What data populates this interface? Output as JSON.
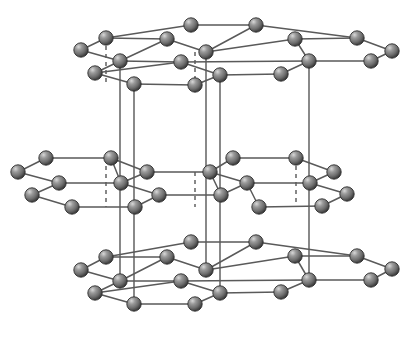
{
  "figure": {
    "type": "ball-and-stick-lattice",
    "background_color": "#ffffff",
    "atom_color_base": "#7d7d7d",
    "atom_color_shadow": "#3c3c3c",
    "atom_color_highlight": "#d8d8d8",
    "atom_outline_color": "#2f2f2f",
    "bond_color": "#5a5a5a",
    "vertical_bond_color": "#6b6b6b",
    "atom_radius": 7.2,
    "layer_count": 3,
    "layer_names": [
      "top-layer",
      "middle-layer",
      "bottom-layer"
    ]
  },
  "atoms": {
    "top_layer": [
      {
        "id": "t1",
        "x": 191,
        "y": 25
      },
      {
        "id": "t2",
        "x": 256,
        "y": 25
      },
      {
        "id": "t3",
        "x": 106,
        "y": 38
      },
      {
        "id": "t4",
        "x": 167,
        "y": 39
      },
      {
        "id": "t5",
        "x": 295,
        "y": 39
      },
      {
        "id": "t6",
        "x": 357,
        "y": 38
      },
      {
        "id": "t7",
        "x": 81,
        "y": 50
      },
      {
        "id": "t8",
        "x": 206,
        "y": 52
      },
      {
        "id": "t9",
        "x": 392,
        "y": 51
      },
      {
        "id": "t10",
        "x": 120,
        "y": 61
      },
      {
        "id": "t11",
        "x": 181,
        "y": 62
      },
      {
        "id": "t12",
        "x": 309,
        "y": 61
      },
      {
        "id": "t13",
        "x": 371,
        "y": 61
      },
      {
        "id": "t14",
        "x": 95,
        "y": 73
      },
      {
        "id": "t15",
        "x": 220,
        "y": 75
      },
      {
        "id": "t16",
        "x": 281,
        "y": 74
      },
      {
        "id": "t17",
        "x": 134,
        "y": 84
      },
      {
        "id": "t18",
        "x": 195,
        "y": 85
      }
    ],
    "middle_layer": [
      {
        "id": "m1",
        "x": 46,
        "y": 158
      },
      {
        "id": "m2",
        "x": 111,
        "y": 158
      },
      {
        "id": "m3",
        "x": 233,
        "y": 158
      },
      {
        "id": "m4",
        "x": 296,
        "y": 158
      },
      {
        "id": "m5",
        "x": 18,
        "y": 172
      },
      {
        "id": "m6",
        "x": 147,
        "y": 172
      },
      {
        "id": "m7",
        "x": 210,
        "y": 172
      },
      {
        "id": "m8",
        "x": 334,
        "y": 172
      },
      {
        "id": "m9",
        "x": 59,
        "y": 183
      },
      {
        "id": "m10",
        "x": 121,
        "y": 183
      },
      {
        "id": "m11",
        "x": 247,
        "y": 183
      },
      {
        "id": "m12",
        "x": 310,
        "y": 183
      },
      {
        "id": "m13",
        "x": 32,
        "y": 195
      },
      {
        "id": "m14",
        "x": 159,
        "y": 195
      },
      {
        "id": "m15",
        "x": 221,
        "y": 195
      },
      {
        "id": "m16",
        "x": 347,
        "y": 194
      },
      {
        "id": "m17",
        "x": 72,
        "y": 207
      },
      {
        "id": "m18",
        "x": 135,
        "y": 207
      },
      {
        "id": "m19",
        "x": 259,
        "y": 207
      },
      {
        "id": "m20",
        "x": 322,
        "y": 206
      }
    ],
    "bottom_layer": [
      {
        "id": "b1",
        "x": 191,
        "y": 242
      },
      {
        "id": "b2",
        "x": 256,
        "y": 242
      },
      {
        "id": "b3",
        "x": 106,
        "y": 257
      },
      {
        "id": "b4",
        "x": 167,
        "y": 257
      },
      {
        "id": "b5",
        "x": 295,
        "y": 256
      },
      {
        "id": "b6",
        "x": 357,
        "y": 256
      },
      {
        "id": "b7",
        "x": 81,
        "y": 270
      },
      {
        "id": "b8",
        "x": 206,
        "y": 270
      },
      {
        "id": "b9",
        "x": 392,
        "y": 269
      },
      {
        "id": "b10",
        "x": 120,
        "y": 281
      },
      {
        "id": "b11",
        "x": 181,
        "y": 281
      },
      {
        "id": "b12",
        "x": 309,
        "y": 280
      },
      {
        "id": "b13",
        "x": 371,
        "y": 280
      },
      {
        "id": "b14",
        "x": 95,
        "y": 293
      },
      {
        "id": "b15",
        "x": 220,
        "y": 293
      },
      {
        "id": "b16",
        "x": 281,
        "y": 292
      },
      {
        "id": "b17",
        "x": 134,
        "y": 304
      },
      {
        "id": "b18",
        "x": 195,
        "y": 304
      }
    ]
  },
  "bonds": {
    "top_layer": [
      [
        "t3",
        "t1"
      ],
      [
        "t1",
        "t2"
      ],
      [
        "t2",
        "t6"
      ],
      [
        "t7",
        "t3"
      ],
      [
        "t3",
        "t4"
      ],
      [
        "t7",
        "t10"
      ],
      [
        "t4",
        "t10"
      ],
      [
        "t4",
        "t8"
      ],
      [
        "t2",
        "t8"
      ],
      [
        "t8",
        "t5"
      ],
      [
        "t5",
        "t6"
      ],
      [
        "t6",
        "t9"
      ],
      [
        "t10",
        "t11"
      ],
      [
        "t11",
        "t12"
      ],
      [
        "t12",
        "t13"
      ],
      [
        "t13",
        "t9"
      ],
      [
        "t14",
        "t10"
      ],
      [
        "t11",
        "t14"
      ],
      [
        "t11",
        "t15"
      ],
      [
        "t15",
        "t16"
      ],
      [
        "t16",
        "t12"
      ],
      [
        "t14",
        "t17"
      ],
      [
        "t17",
        "t18"
      ],
      [
        "t18",
        "t15"
      ],
      [
        "t5",
        "t12"
      ]
    ],
    "middle_layer": [
      [
        "m5",
        "m1"
      ],
      [
        "m1",
        "m2"
      ],
      [
        "m2",
        "m6"
      ],
      [
        "m5",
        "m9"
      ],
      [
        "m9",
        "m10"
      ],
      [
        "m10",
        "m6"
      ],
      [
        "m2",
        "m10"
      ],
      [
        "m6",
        "m7"
      ],
      [
        "m7",
        "m3"
      ],
      [
        "m3",
        "m4"
      ],
      [
        "m4",
        "m8"
      ],
      [
        "m8",
        "m12"
      ],
      [
        "m7",
        "m11"
      ],
      [
        "m11",
        "m12"
      ],
      [
        "m12",
        "m16"
      ],
      [
        "m9",
        "m13"
      ],
      [
        "m13",
        "m17"
      ],
      [
        "m17",
        "m18"
      ],
      [
        "m18",
        "m14"
      ],
      [
        "m14",
        "m15"
      ],
      [
        "m15",
        "m7"
      ],
      [
        "m10",
        "m14"
      ],
      [
        "m11",
        "m19"
      ],
      [
        "m19",
        "m20"
      ],
      [
        "m20",
        "m16"
      ],
      [
        "m11",
        "m15"
      ]
    ],
    "bottom_layer": [
      [
        "b3",
        "b1"
      ],
      [
        "b1",
        "b2"
      ],
      [
        "b2",
        "b6"
      ],
      [
        "b7",
        "b3"
      ],
      [
        "b3",
        "b4"
      ],
      [
        "b7",
        "b10"
      ],
      [
        "b4",
        "b10"
      ],
      [
        "b4",
        "b8"
      ],
      [
        "b2",
        "b8"
      ],
      [
        "b8",
        "b5"
      ],
      [
        "b5",
        "b6"
      ],
      [
        "b6",
        "b9"
      ],
      [
        "b10",
        "b11"
      ],
      [
        "b11",
        "b12"
      ],
      [
        "b12",
        "b13"
      ],
      [
        "b13",
        "b9"
      ],
      [
        "b14",
        "b10"
      ],
      [
        "b11",
        "b14"
      ],
      [
        "b11",
        "b15"
      ],
      [
        "b15",
        "b16"
      ],
      [
        "b16",
        "b12"
      ],
      [
        "b14",
        "b17"
      ],
      [
        "b17",
        "b18"
      ],
      [
        "b18",
        "b15"
      ],
      [
        "b5",
        "b12"
      ]
    ]
  },
  "interlayer_bonds": {
    "solid": [
      {
        "id": "v1",
        "x": 120,
        "y1": 61,
        "y2": 158
      },
      {
        "id": "v2",
        "x": 134,
        "y1": 84,
        "y2": 207
      },
      {
        "id": "v3",
        "x": 206,
        "y1": 52,
        "y2": 172
      },
      {
        "id": "v4",
        "x": 220,
        "y1": 75,
        "y2": 195
      },
      {
        "id": "v5",
        "x": 309,
        "y1": 61,
        "y2": 183
      },
      {
        "id": "v6",
        "x": 120,
        "y1": 158,
        "y2": 281
      },
      {
        "id": "v7",
        "x": 134,
        "y1": 207,
        "y2": 304
      },
      {
        "id": "v8",
        "x": 206,
        "y1": 172,
        "y2": 270
      },
      {
        "id": "v9",
        "x": 220,
        "y1": 195,
        "y2": 293
      },
      {
        "id": "v10",
        "x": 309,
        "y1": 183,
        "y2": 280
      }
    ],
    "dashed": [
      {
        "id": "d1",
        "x": 106,
        "y1": 38,
        "y2": 84
      },
      {
        "id": "d2",
        "x": 195,
        "y1": 52,
        "y2": 85
      },
      {
        "id": "d3",
        "x": 106,
        "y1": 158,
        "y2": 207
      },
      {
        "id": "d4",
        "x": 195,
        "y1": 172,
        "y2": 207
      },
      {
        "id": "d5",
        "x": 296,
        "y1": 158,
        "y2": 206
      }
    ]
  }
}
